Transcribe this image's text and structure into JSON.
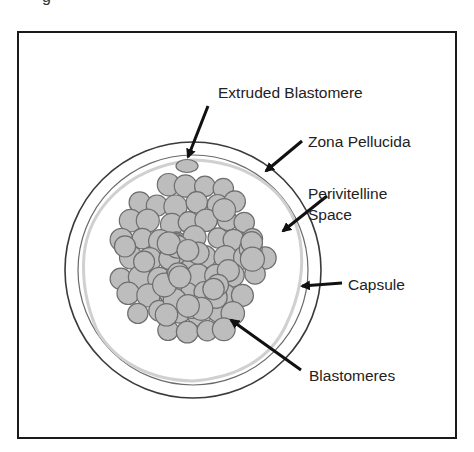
{
  "figure": {
    "top_fragment": "g",
    "labels": {
      "extruded_blastomere": "Extruded Blastomere",
      "zona_pellucida": "Zona Pellucida",
      "perivitelline_line1": "Perivitelline",
      "perivitelline_line2": "Space",
      "capsule": "Capsule",
      "blastomeres": "Blastomeres"
    },
    "colors": {
      "frame": "#1a1a1a",
      "zona_outer": "#3a3a3a",
      "zona_inner": "#6a6a6a",
      "capsule_wavy": "#cfcfcf",
      "cell_fill": "#bdbdbd",
      "cell_stroke": "#6e6e6e",
      "arrow": "#111111",
      "text": "#222222"
    }
  }
}
